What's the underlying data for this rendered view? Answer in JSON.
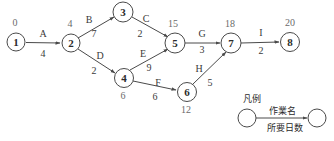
{
  "diagram": {
    "type": "pert-cpm-network",
    "nodes": [
      {
        "id": "1",
        "label": "1",
        "time": "0",
        "cx": 16,
        "cy": 42,
        "r": 9,
        "time_x": 15,
        "time_y": 23
      },
      {
        "id": "2",
        "label": "2",
        "time": "4",
        "cx": 71,
        "cy": 43,
        "r": 9,
        "time_x": 70,
        "time_y": 24
      },
      {
        "id": "3",
        "label": "3",
        "time": "",
        "cx": 123,
        "cy": 12,
        "r": 10,
        "time_x": 0,
        "time_y": 0
      },
      {
        "id": "4",
        "label": "4",
        "time": "6",
        "cx": 124,
        "cy": 78,
        "r": 9.5,
        "time_x": 123,
        "time_y": 96
      },
      {
        "id": "5",
        "label": "5",
        "time": "15",
        "cx": 175,
        "cy": 43,
        "r": 10,
        "time_x": 173,
        "time_y": 24
      },
      {
        "id": "6",
        "label": "6",
        "time": "12",
        "cx": 187,
        "cy": 92,
        "r": 9.5,
        "time_x": 186,
        "time_y": 110
      },
      {
        "id": "7",
        "label": "7",
        "time": "18",
        "cx": 231,
        "cy": 43,
        "r": 10,
        "time_x": 230,
        "time_y": 24
      },
      {
        "id": "8",
        "label": "8",
        "time": "20",
        "cx": 290,
        "cy": 42,
        "r": 9.5,
        "time_x": 290,
        "time_y": 23
      }
    ],
    "edges": [
      {
        "id": "A",
        "from": "1",
        "to": "2",
        "name": "A",
        "duration": "4",
        "name_x": 43,
        "name_y": 34,
        "dur_x": 43,
        "dur_y": 54
      },
      {
        "id": "B",
        "from": "2",
        "to": "3",
        "name": "B",
        "duration": "7",
        "name_x": 89,
        "name_y": 20,
        "dur_x": 94,
        "dur_y": 34
      },
      {
        "id": "C",
        "from": "3",
        "to": "5",
        "name": "C",
        "duration": "2",
        "name_x": 146,
        "name_y": 19,
        "dur_x": 140,
        "dur_y": 34
      },
      {
        "id": "D",
        "from": "2",
        "to": "4",
        "name": "D",
        "duration": "2",
        "name_x": 100,
        "name_y": 56,
        "dur_x": 94,
        "dur_y": 71
      },
      {
        "id": "E",
        "from": "4",
        "to": "5",
        "name": "E",
        "duration": "9",
        "name_x": 143,
        "name_y": 54,
        "dur_x": 149,
        "dur_y": 68
      },
      {
        "id": "F",
        "from": "4",
        "to": "6",
        "name": "F",
        "duration": "6",
        "name_x": 158,
        "name_y": 83,
        "dur_x": 155,
        "dur_y": 97
      },
      {
        "id": "G",
        "from": "5",
        "to": "7",
        "name": "G",
        "duration": "3",
        "name_x": 202,
        "name_y": 34,
        "dur_x": 202,
        "dur_y": 50
      },
      {
        "id": "H",
        "from": "6",
        "to": "7",
        "name": "H",
        "duration": "5",
        "name_x": 199,
        "name_y": 69,
        "dur_x": 210,
        "dur_y": 83
      },
      {
        "id": "I",
        "from": "7",
        "to": "8",
        "name": "I",
        "duration": "2",
        "name_x": 261,
        "name_y": 33,
        "dur_x": 261,
        "dur_y": 51
      }
    ]
  },
  "legend": {
    "title": "凡例",
    "activity_name_label": "作業名",
    "duration_label": "所要日数"
  }
}
